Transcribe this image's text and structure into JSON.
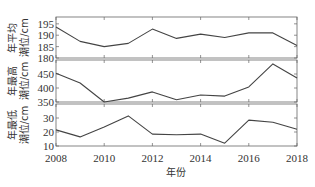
{
  "chart_data": {
    "type": "line",
    "layout": "three vertically stacked panels sharing x-axis",
    "x": [
      2008,
      2009,
      2010,
      2011,
      2012,
      2013,
      2014,
      2015,
      2016,
      2017,
      2018
    ],
    "xlabel": "年份",
    "xticks": [
      2008,
      2010,
      2012,
      2014,
      2016,
      2018
    ],
    "xlim": [
      2008,
      2018
    ],
    "grid": false,
    "legend": null,
    "panels": [
      {
        "ylabel_line1": "年平均",
        "ylabel_line2": "潮位/cm",
        "ylim": [
          180,
          198
        ],
        "yticks": [
          180,
          185,
          190,
          195
        ],
        "series": [
          {
            "name": "年平均潮位",
            "values": [
              193.6,
              187.3,
              185.0,
              186.4,
              192.7,
              188.6,
              190.5,
              189.0,
              191.0,
              191.0,
              185.5
            ]
          }
        ]
      },
      {
        "ylabel_line1": "年最高",
        "ylabel_line2": "潮位/cm",
        "ylim": [
          350,
          500
        ],
        "yticks": [
          350,
          400,
          450
        ],
        "series": [
          {
            "name": "年最高潮位",
            "values": [
              453,
              418,
              350,
              364,
              386,
              358,
              375,
              371,
              404,
              486,
              436
            ]
          }
        ]
      },
      {
        "ylabel_line1": "年最低",
        "ylabel_line2": "潮位/cm",
        "ylim": [
          10,
          40
        ],
        "yticks": [
          10,
          20,
          30
        ],
        "series": [
          {
            "name": "年最低潮位",
            "values": [
              21.5,
              16.5,
              23.5,
              31.5,
              18.5,
              18.0,
              18.5,
              12.0,
              28.5,
              27.0,
              22.0
            ]
          }
        ]
      }
    ]
  }
}
